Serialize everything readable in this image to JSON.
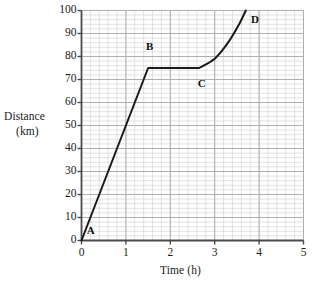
{
  "chart_data": {
    "type": "line",
    "title": "",
    "xlabel": "Time (h)",
    "ylabel": "Distance (km)",
    "ylabel_line1": "Distance",
    "ylabel_line2": "(km)",
    "xlim": [
      0,
      5
    ],
    "ylim": [
      0,
      100
    ],
    "xticks": [
      0,
      1,
      2,
      3,
      4,
      5
    ],
    "yticks": [
      0,
      10,
      20,
      30,
      40,
      50,
      60,
      70,
      80,
      90,
      100
    ],
    "xtick_labels": [
      "0",
      "1",
      "2",
      "3",
      "4",
      "5"
    ],
    "ytick_labels": [
      "0",
      "10",
      "20",
      "30",
      "40",
      "50",
      "60",
      "70",
      "80",
      "90",
      "100"
    ],
    "grid": true,
    "grid_minor_step_x": 0.2,
    "grid_minor_step_y": 2,
    "grid_major_step_x": 1,
    "grid_major_step_y": 10,
    "legend": null,
    "series": [
      {
        "name": "journey",
        "points": [
          {
            "x": 0.0,
            "y": 0
          },
          {
            "x": 1.5,
            "y": 75
          },
          {
            "x": 2.65,
            "y": 75
          },
          {
            "x": 3.0,
            "y": 79
          },
          {
            "x": 3.3,
            "y": 86
          },
          {
            "x": 3.55,
            "y": 94
          },
          {
            "x": 3.7,
            "y": 100
          }
        ]
      }
    ],
    "annotations": [
      {
        "label": "A",
        "x": 0.12,
        "y": 4,
        "point_x": 0.0,
        "point_y": 0
      },
      {
        "label": "B",
        "x": 1.45,
        "y": 84,
        "point_x": 1.5,
        "point_y": 75
      },
      {
        "label": "C",
        "x": 2.62,
        "y": 68,
        "point_x": 2.65,
        "point_y": 75
      },
      {
        "label": "D",
        "x": 3.82,
        "y": 96,
        "point_x": 3.7,
        "point_y": 100
      }
    ],
    "colors": {
      "curve": "#1a1a1a",
      "axis": "#4a4a4a",
      "grid_minor": "#cfcfcf",
      "grid_major": "#a8a8a8",
      "background": "#ffffff",
      "text": "#1a1a1a"
    }
  }
}
